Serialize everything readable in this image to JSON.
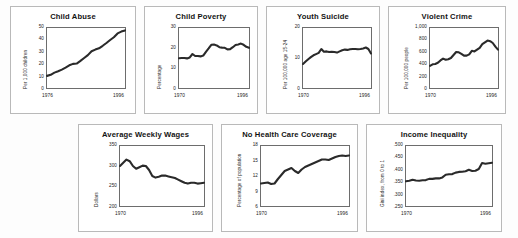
{
  "figure": {
    "rows": [
      [
        "child_abuse",
        "child_poverty",
        "youth_suicide",
        "violent_crime"
      ],
      [
        "average_weekly_wages",
        "no_health_care_coverage",
        "income_inequality"
      ]
    ]
  },
  "chart_data": [
    {
      "id": "child_abuse",
      "type": "line",
      "title": "Child Abuse",
      "xlabel": "",
      "ylabel": "Per 1,000 children",
      "xticks": [
        "1976",
        "1996"
      ],
      "yticks": [
        "0",
        "10",
        "20",
        "30",
        "40",
        "50"
      ],
      "xlim": [
        1976,
        1996
      ],
      "ylim": [
        0,
        50
      ],
      "grid": false,
      "x": [
        1976,
        1977,
        1978,
        1979,
        1980,
        1981,
        1982,
        1983,
        1984,
        1985,
        1986,
        1987,
        1988,
        1989,
        1990,
        1991,
        1992,
        1993,
        1994,
        1995,
        1996
      ],
      "values": [
        10.1,
        11.0,
        12.8,
        14.0,
        15.3,
        17.0,
        18.9,
        20.1,
        20.4,
        22.6,
        25.0,
        27.4,
        30.6,
        32.0,
        33.1,
        35.2,
        37.5,
        40.0,
        42.3,
        45.5,
        47.0,
        48.0
      ]
    },
    {
      "id": "child_poverty",
      "type": "line",
      "title": "Child Poverty",
      "xlabel": "",
      "ylabel": "Percentage",
      "xticks": [
        "1970",
        "1996"
      ],
      "yticks": [
        "0",
        "10",
        "20",
        "30"
      ],
      "xlim": [
        1970,
        1996
      ],
      "ylim": [
        0,
        30
      ],
      "grid": false,
      "x": [
        1970,
        1971,
        1972,
        1973,
        1974,
        1975,
        1976,
        1977,
        1978,
        1979,
        1980,
        1981,
        1982,
        1983,
        1984,
        1985,
        1986,
        1987,
        1988,
        1989,
        1990,
        1991,
        1992,
        1993,
        1994,
        1995,
        1996
      ],
      "values": [
        14.9,
        15.0,
        15.0,
        14.8,
        15.3,
        17.0,
        16.0,
        16.0,
        15.8,
        16.2,
        18.1,
        19.8,
        21.6,
        21.7,
        21.3,
        20.4,
        20.2,
        20.1,
        19.3,
        19.4,
        20.4,
        21.5,
        21.8,
        22.2,
        21.6,
        20.6,
        20.1
      ]
    },
    {
      "id": "youth_suicide",
      "type": "line",
      "title": "Youth Suicide",
      "xlabel": "",
      "ylabel": "Per 100,000 age 15-24",
      "xticks": [
        "1970",
        "1996"
      ],
      "yticks": [
        "0",
        "10",
        "20"
      ],
      "xlim": [
        1970,
        1996
      ],
      "ylim": [
        0,
        20
      ],
      "grid": false,
      "x": [
        1970,
        1971,
        1972,
        1973,
        1974,
        1975,
        1976,
        1977,
        1978,
        1979,
        1980,
        1981,
        1982,
        1983,
        1984,
        1985,
        1986,
        1987,
        1988,
        1989,
        1990,
        1991,
        1992,
        1993,
        1994,
        1995,
        1996
      ],
      "values": [
        8.0,
        8.8,
        9.6,
        10.3,
        10.9,
        11.3,
        11.7,
        13.0,
        12.1,
        12.2,
        12.0,
        12.1,
        12.0,
        11.8,
        12.2,
        12.6,
        12.8,
        12.7,
        12.9,
        13.0,
        13.0,
        12.9,
        13.0,
        13.2,
        13.5,
        13.0,
        11.5
      ]
    },
    {
      "id": "violent_crime",
      "type": "line",
      "title": "Violent Crime",
      "xlabel": "",
      "ylabel": "Per 100,000 people",
      "xticks": [
        "1970",
        "1996"
      ],
      "yticks": [
        "0",
        "200",
        "400",
        "600",
        "800",
        "1,000"
      ],
      "xlim": [
        1970,
        1996
      ],
      "ylim": [
        0,
        1000
      ],
      "grid": false,
      "x": [
        1970,
        1971,
        1972,
        1973,
        1974,
        1975,
        1976,
        1977,
        1978,
        1979,
        1980,
        1981,
        1982,
        1983,
        1984,
        1985,
        1986,
        1987,
        1988,
        1989,
        1990,
        1991,
        1992,
        1993,
        1994,
        1995,
        1996
      ],
      "values": [
        370,
        395,
        400,
        420,
        460,
        490,
        470,
        480,
        500,
        550,
        600,
        595,
        570,
        540,
        540,
        560,
        620,
        610,
        640,
        670,
        730,
        760,
        790,
        780,
        750,
        690,
        640
      ]
    },
    {
      "id": "average_weekly_wages",
      "type": "line",
      "title": "Average Weekly Wages",
      "xlabel": "",
      "ylabel": "Dollars",
      "xticks": [
        "1970",
        "1996"
      ],
      "yticks": [
        "200",
        "250",
        "300",
        "350"
      ],
      "xlim": [
        1970,
        1996
      ],
      "ylim": [
        200,
        350
      ],
      "grid": false,
      "x": [
        1970,
        1971,
        1972,
        1973,
        1974,
        1975,
        1976,
        1977,
        1978,
        1979,
        1980,
        1981,
        1982,
        1983,
        1984,
        1985,
        1986,
        1987,
        1988,
        1989,
        1990,
        1991,
        1992,
        1993,
        1994,
        1995,
        1996
      ],
      "values": [
        300,
        308,
        316,
        312,
        300,
        293,
        297,
        301,
        300,
        290,
        275,
        271,
        273,
        276,
        276,
        274,
        272,
        270,
        266,
        262,
        258,
        256,
        258,
        258,
        256,
        257,
        258
      ]
    },
    {
      "id": "no_health_care_coverage",
      "type": "line",
      "title": "No Health Care Coverage",
      "xlabel": "",
      "ylabel": "Percentage of population",
      "xticks": [
        "1970",
        "1996"
      ],
      "yticks": [
        "6",
        "9",
        "12",
        "15",
        "18"
      ],
      "xlim": [
        1970,
        1996
      ],
      "ylim": [
        6,
        18
      ],
      "grid": false,
      "x": [
        1970,
        1971,
        1972,
        1973,
        1974,
        1975,
        1976,
        1977,
        1978,
        1979,
        1980,
        1981,
        1982,
        1983,
        1984,
        1985,
        1986,
        1987,
        1988,
        1989,
        1990,
        1991,
        1992,
        1993,
        1994,
        1995,
        1996
      ],
      "values": [
        10.5,
        10.6,
        10.7,
        10.4,
        10.5,
        11.4,
        12.2,
        13.0,
        13.3,
        13.6,
        13.0,
        12.6,
        13.3,
        13.8,
        14.1,
        14.4,
        14.7,
        15.0,
        15.3,
        15.3,
        15.2,
        15.5,
        15.8,
        16.0,
        16.1,
        16.0,
        16.1
      ]
    },
    {
      "id": "income_inequality",
      "type": "line",
      "title": "Income Inequality",
      "xlabel": "",
      "ylabel": "Gini index, from 0 to 1",
      "xticks": [
        "1970",
        "1996"
      ],
      "yticks": [
        ".250",
        ".300",
        ".350",
        ".400",
        ".450",
        ".500"
      ],
      "xlim": [
        1970,
        1996
      ],
      "ylim": [
        0.25,
        0.5
      ],
      "grid": false,
      "x": [
        1970,
        1971,
        1972,
        1973,
        1974,
        1975,
        1976,
        1977,
        1978,
        1979,
        1980,
        1981,
        1982,
        1983,
        1984,
        1985,
        1986,
        1987,
        1988,
        1989,
        1990,
        1991,
        1992,
        1993,
        1994,
        1995,
        1996
      ],
      "values": [
        0.353,
        0.355,
        0.359,
        0.356,
        0.355,
        0.357,
        0.358,
        0.363,
        0.363,
        0.365,
        0.365,
        0.369,
        0.38,
        0.382,
        0.383,
        0.389,
        0.392,
        0.393,
        0.395,
        0.401,
        0.396,
        0.397,
        0.404,
        0.429,
        0.426,
        0.428,
        0.43
      ]
    }
  ],
  "colors": {
    "line": "#2a2a2a",
    "panel_border": "#b9b9b9",
    "axis": "#6d6d6d",
    "background": "#fdfdfd"
  }
}
